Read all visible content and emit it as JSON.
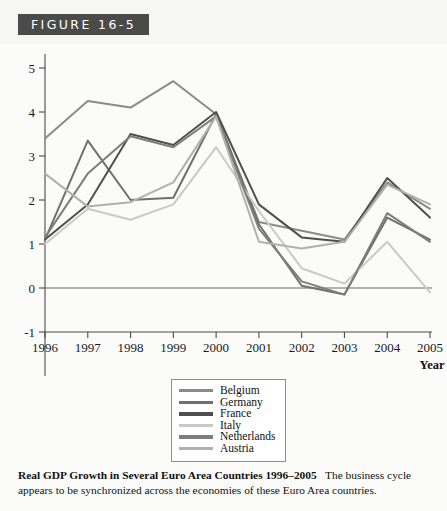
{
  "figure": {
    "number_label": "FIGURE 16-5"
  },
  "caption": {
    "title": "Real GDP Growth in Several Euro Area Countries 1996–2005",
    "body": "The business cycle appears to be synchronized across the economies of these Euro Area countries."
  },
  "legend": {
    "position": "below-plot",
    "entries": [
      {
        "label": "Belgium",
        "color": "#8a8a8a"
      },
      {
        "label": "Germany",
        "color": "#707070"
      },
      {
        "label": "France",
        "color": "#4f4f4f"
      },
      {
        "label": "Italy",
        "color": "#c9c9c9"
      },
      {
        "label": "Netherlands",
        "color": "#7d7d7d"
      },
      {
        "label": "Austria",
        "color": "#b0b0b0"
      }
    ]
  },
  "axes": {
    "y_ticks": [
      "5",
      "4",
      "3",
      "2",
      "1",
      "0",
      "-1"
    ],
    "x_ticks": [
      "1996",
      "1997",
      "1998",
      "1999",
      "2000",
      "2001",
      "2002",
      "2003",
      "2004",
      "2005"
    ],
    "x_axis_label": "Year",
    "y_axis_label": ""
  },
  "chart_data": {
    "type": "line",
    "title": "Real GDP Growth in Several Euro Area Countries 1996–2005",
    "xlabel": "Year",
    "ylabel": "",
    "categories": [
      "1996",
      "1997",
      "1998",
      "1999",
      "2000",
      "2001",
      "2002",
      "2003",
      "2004",
      "2005"
    ],
    "x": [
      1996,
      1997,
      1998,
      1999,
      2000,
      2001,
      2002,
      2003,
      2004,
      2005
    ],
    "ylim": [
      -1,
      5
    ],
    "xlim": [
      1996,
      2005
    ],
    "grid": false,
    "legend_position": "bottom",
    "zero_line": true,
    "series": [
      {
        "name": "Belgium",
        "color": "#8a8a8a",
        "values": [
          3.4,
          4.25,
          4.1,
          4.7,
          3.95,
          1.5,
          1.3,
          1.1,
          2.4,
          1.8
        ]
      },
      {
        "name": "Germany",
        "color": "#707070",
        "values": [
          1.1,
          3.35,
          2.0,
          2.05,
          3.95,
          1.45,
          0.05,
          -0.15,
          1.6,
          1.1
        ]
      },
      {
        "name": "France",
        "color": "#4f4f4f",
        "values": [
          1.1,
          1.9,
          3.5,
          3.25,
          4.0,
          1.9,
          1.15,
          1.05,
          2.5,
          1.6
        ]
      },
      {
        "name": "Italy",
        "color": "#c9c9c9",
        "values": [
          1.0,
          1.8,
          1.55,
          1.9,
          3.2,
          1.75,
          0.45,
          0.1,
          1.05,
          -0.1
        ]
      },
      {
        "name": "Netherlands",
        "color": "#7d7d7d",
        "values": [
          1.15,
          2.6,
          3.45,
          3.2,
          3.9,
          1.35,
          0.15,
          -0.15,
          1.7,
          1.05
        ]
      },
      {
        "name": "Austria",
        "color": "#b0b0b0",
        "values": [
          2.6,
          1.85,
          1.95,
          2.4,
          3.9,
          1.05,
          0.9,
          1.05,
          2.35,
          1.9
        ]
      }
    ]
  }
}
